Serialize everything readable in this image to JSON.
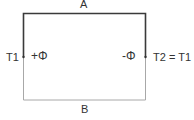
{
  "diagram": {
    "type": "thermocouple-loop",
    "path_labels": {
      "top": "A",
      "bottom": "B"
    },
    "left_terminal": {
      "temperature": "T1",
      "potential": "+Φ"
    },
    "right_terminal": {
      "temperature": "T2 = T1",
      "potential": "-Φ"
    },
    "colors": {
      "path_a": "#3a3a3a",
      "path_b": "#a8a8a8",
      "text": "#333333"
    }
  }
}
